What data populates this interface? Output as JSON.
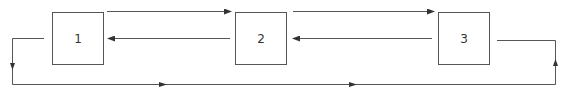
{
  "diagram": {
    "type": "block-flow",
    "colors": {
      "stroke": "#555555",
      "text": "#333333",
      "background": "#ffffff"
    },
    "nodes": [
      {
        "id": "1",
        "label": "1"
      },
      {
        "id": "2",
        "label": "2"
      },
      {
        "id": "3",
        "label": "3"
      }
    ],
    "edges": [
      {
        "from": "1",
        "to": "2",
        "direction": "forward"
      },
      {
        "from": "2",
        "to": "1",
        "direction": "backward"
      },
      {
        "from": "2",
        "to": "3",
        "direction": "forward"
      },
      {
        "from": "3",
        "to": "2",
        "direction": "backward"
      },
      {
        "from": "3",
        "to": "1",
        "direction": "loop",
        "route": "right-down-bottom-left-up"
      }
    ]
  }
}
